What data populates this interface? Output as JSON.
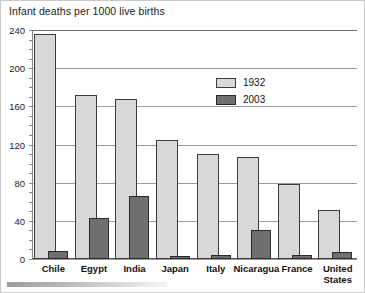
{
  "chart_data": {
    "type": "bar",
    "title": "Infant deaths per 1000 live births",
    "xlabel": "",
    "ylabel": "",
    "ylim": [
      0,
      240
    ],
    "yticks": [
      0,
      40,
      80,
      120,
      160,
      200,
      240
    ],
    "grid": true,
    "legend_position": "upper-right",
    "categories": [
      "Chile",
      "Egypt",
      "India",
      "Japan",
      "Italy",
      "Nicaragua",
      "France",
      "United States"
    ],
    "series": [
      {
        "name": "1932",
        "color": "#d8d8d8",
        "values": [
          236,
          172,
          168,
          125,
          110,
          107,
          79,
          51
        ]
      },
      {
        "name": "2003",
        "color": "#6f6f6f",
        "values": [
          8,
          43,
          66,
          3,
          4,
          30,
          4,
          7
        ]
      }
    ]
  },
  "axis": {
    "ytick_labels": [
      "240",
      "200",
      "160",
      "120",
      "80",
      "40",
      "0"
    ]
  },
  "legend": {
    "entries": [
      {
        "label": "1932",
        "swatch": "light-gray-swatch"
      },
      {
        "label": "2003",
        "swatch": "dark-gray-swatch"
      }
    ]
  },
  "scrollbar": {
    "name": "horizontal-scrollbar"
  }
}
